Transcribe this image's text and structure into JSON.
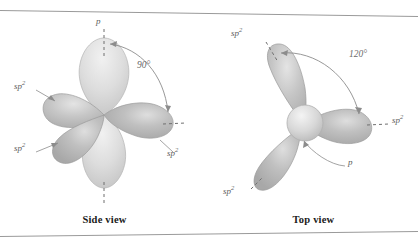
{
  "figure": {
    "background": "#ffffff",
    "rule_color": "#9a9a9a"
  },
  "colors": {
    "sp2_lobe": "#b7b7b7",
    "sp2_lobe_light": "#c9c9c9",
    "p_lobe": "#dcdcdc",
    "p_sphere": "#d2d2d2",
    "outline": "#a0a0a0",
    "leader": "#8c8c8c",
    "dash": "#6f6f6f",
    "label_text": "#5c5c5c",
    "caption_text": "#1a1a1a"
  },
  "panels": [
    {
      "id": "side-view",
      "caption": "Side view",
      "angle": {
        "value": "90°",
        "between": [
          "p",
          "sp2"
        ]
      },
      "labels": [
        {
          "name": "p-label-top",
          "text": "p",
          "sup": ""
        },
        {
          "name": "sp2-label-upperleft",
          "text": "sp",
          "sup": "2"
        },
        {
          "name": "sp2-label-lowerleft",
          "text": "sp",
          "sup": "2"
        },
        {
          "name": "sp2-label-right",
          "text": "sp",
          "sup": "2"
        }
      ],
      "orbitals": {
        "p_lobes": 2,
        "sp2_lobes": 3,
        "description": "Two light vertical p lobes above and below; three darker sp2 lobes in the horizontal plane."
      }
    },
    {
      "id": "top-view",
      "caption": "Top view",
      "angle": {
        "value": "120°",
        "between": [
          "sp2",
          "sp2"
        ]
      },
      "labels": [
        {
          "name": "sp2-label-upperleft",
          "text": "sp",
          "sup": "2"
        },
        {
          "name": "sp2-label-right",
          "text": "sp",
          "sup": "2"
        },
        {
          "name": "sp2-label-lowerleft",
          "text": "sp",
          "sup": "2"
        },
        {
          "name": "p-label-lower",
          "text": "p",
          "sup": ""
        }
      ],
      "orbitals": {
        "p_sphere": 1,
        "sp2_lobes": 3,
        "description": "Central pale sphere is the p orbital viewed end-on; three sp2 lobes at 120 degrees."
      }
    }
  ]
}
